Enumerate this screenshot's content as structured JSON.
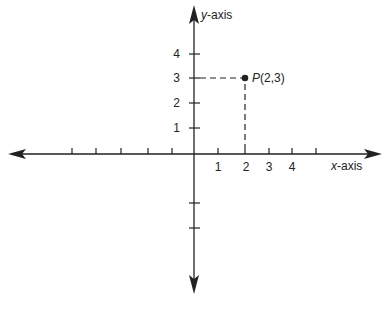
{
  "diagram": {
    "type": "cartesian-coordinate-plane",
    "axes": {
      "x_label_var": "x",
      "x_label_suffix": "-axis",
      "y_label_var": "y",
      "y_label_suffix": "-axis"
    },
    "x_ticks": [
      {
        "value": -5,
        "label": ""
      },
      {
        "value": -4,
        "label": ""
      },
      {
        "value": -3,
        "label": ""
      },
      {
        "value": -2,
        "label": ""
      },
      {
        "value": -1,
        "label": ""
      },
      {
        "value": 1,
        "label": "1"
      },
      {
        "value": 2,
        "label": "2"
      },
      {
        "value": 3,
        "label": "3"
      },
      {
        "value": 4,
        "label": "4"
      },
      {
        "value": 5,
        "label": ""
      }
    ],
    "y_ticks": [
      {
        "value": 1,
        "label": "1"
      },
      {
        "value": 2,
        "label": "2"
      },
      {
        "value": 3,
        "label": "3"
      },
      {
        "value": 4,
        "label": "4"
      },
      {
        "value": -1,
        "label": ""
      },
      {
        "value": -2,
        "label": ""
      }
    ],
    "point": {
      "name": "P",
      "coords": "(2,3)",
      "x": 2,
      "y": 3
    },
    "colors": {
      "ink": "#222222",
      "background": "#ffffff"
    }
  }
}
